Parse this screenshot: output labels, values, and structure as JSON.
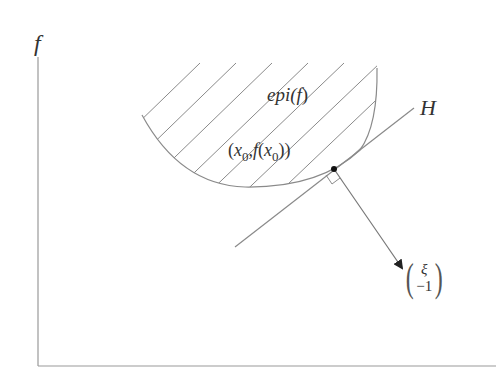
{
  "diagram": {
    "axis_y_label": "f",
    "region_label": "epi(f)",
    "region_label_parts": {
      "pre": "epi(",
      "f": "f",
      "post": ")"
    },
    "point_label": "(x₀,f(x₀))",
    "point_label_parts": {
      "open": "(",
      "x": "x",
      "sub1": "0",
      "comma": ",",
      "f": "f",
      "open2": "(",
      "x2": "x",
      "sub2": "0",
      "close": "))"
    },
    "hyperplane_label": "H",
    "normal_vector": {
      "top": "ξ",
      "bottom": "−1"
    },
    "colors": {
      "stroke": "#8a8a8a",
      "text": "#333333",
      "point": "#111111"
    }
  }
}
